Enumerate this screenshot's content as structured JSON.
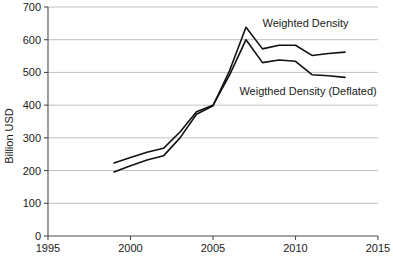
{
  "chart_data": {
    "type": "line",
    "title": "",
    "xlabel": "",
    "ylabel": "Billion USD",
    "xlim": [
      1995,
      2015
    ],
    "ylim": [
      0,
      700
    ],
    "grid": true,
    "legend_position": "inline-annotation",
    "x_ticks": [
      "1995",
      "2000",
      "2005",
      "2010",
      "2015"
    ],
    "x_tick_values": [
      1995,
      2000,
      2005,
      2010,
      2015
    ],
    "y_ticks": [
      "0",
      "100",
      "200",
      "300",
      "400",
      "500",
      "600",
      "700"
    ],
    "y_tick_values": [
      0,
      100,
      200,
      300,
      400,
      500,
      600,
      700
    ],
    "x": [
      1999,
      2000,
      2001,
      2002,
      2003,
      2004,
      2005,
      2006,
      2007,
      2008,
      2009,
      2010,
      2011,
      2012,
      2013
    ],
    "series": [
      {
        "name": "Weighted Density",
        "color": "#111111",
        "values": [
          196,
          215,
          232,
          245,
          300,
          372,
          398,
          505,
          638,
          572,
          583,
          583,
          552,
          558,
          562
        ]
      },
      {
        "name": "Weigthed Density (Deflated)",
        "color": "#111111",
        "values": [
          223,
          240,
          256,
          268,
          318,
          380,
          400,
          492,
          600,
          530,
          538,
          534,
          493,
          490,
          485
        ]
      }
    ],
    "annotations": [
      {
        "name": "weighted-density-label",
        "text": "Weighted Density",
        "x": 2008.0,
        "y": 640
      },
      {
        "name": "weighted-density-deflated-label",
        "text": "Weigthed Density (Deflated)",
        "x": 2006.6,
        "y": 432
      }
    ]
  }
}
